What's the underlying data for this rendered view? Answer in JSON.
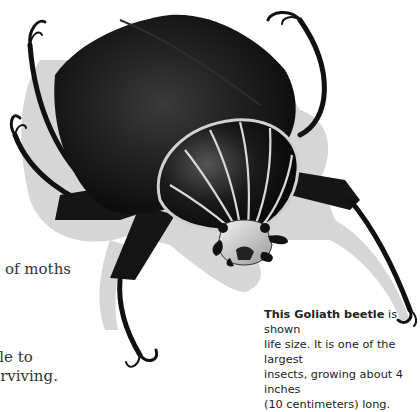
{
  "page": {
    "body_text_fragments": [
      "of moths",
      "ggle to",
      "t surviving."
    ],
    "caption": {
      "bold_lead": "This Goliath beetle",
      "line1_rest": " is shown",
      "line2": "life size. It is one of the largest",
      "line3": "insects, growing about 4 inches",
      "line4": "(10 centimeters) long."
    }
  },
  "illustration": {
    "subject": "Goliath beetle",
    "colors": {
      "shell": "#111111",
      "stripes": "#d9d9d9",
      "shadow": "#c8c8c8"
    }
  }
}
